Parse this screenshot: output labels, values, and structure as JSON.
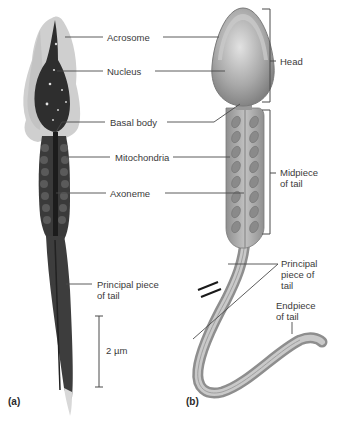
{
  "figure": {
    "panels": [
      {
        "id": "a",
        "label": "(a)",
        "type": "micrograph"
      },
      {
        "id": "b",
        "label": "(b)",
        "type": "illustration"
      }
    ],
    "center_labels": {
      "acrosome": "Acrosome",
      "nucleus": "Nucleus",
      "basal_body": "Basal body",
      "mitochondria": "Mitochondria",
      "axoneme": "Axoneme"
    },
    "left_labels": {
      "principal_piece_line1": "Principal piece",
      "principal_piece_line2": "of tail"
    },
    "scale_bar": {
      "label": "2 µm"
    },
    "bracket_labels": {
      "head": "Head",
      "midpiece_line1": "Midpiece",
      "midpiece_line2": "of tail"
    },
    "right_labels": {
      "principal_line1": "Principal",
      "principal_line2": "piece of",
      "principal_line3": "tail",
      "endpiece_line1": "Endpiece",
      "endpiece_line2": "of tail"
    },
    "colors": {
      "text": "#3a3a3a",
      "leader_line": "#4a4a4a",
      "micrograph_dark": "#2b2b2b",
      "micrograph_halo": "#c8c8c8",
      "illustration_body": "#a8a8a8",
      "illustration_highlight": "#d4d4d4",
      "mitochondria": "#8c8c8c"
    }
  }
}
